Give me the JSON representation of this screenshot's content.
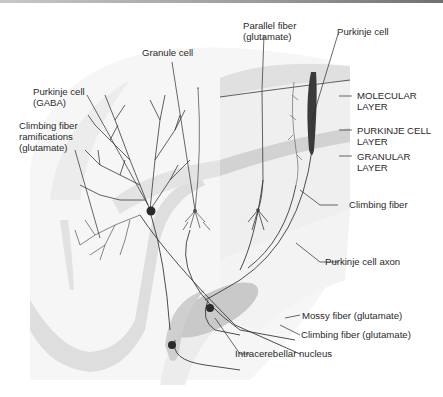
{
  "figure": {
    "colors": {
      "line": "#3a3a3a",
      "cell_body": "#2a2a2a",
      "layer_band": "#d4d4d4",
      "block_face": "#eeeeee",
      "block_top": "#e2e2e2",
      "nucleus": "#c6c6c6",
      "folia": "#f1f1f1",
      "folia_band": "#dcdcdc"
    },
    "labels": {
      "granule_cell": [
        "Granule cell"
      ],
      "purkinje_gaba": [
        "Purkinje cell",
        "(GABA)"
      ],
      "climbing_ramifications": [
        "Climbing fiber",
        "ramifications",
        "(glutamate)"
      ],
      "parallel_fiber": [
        "Parallel fiber",
        "(glutamate)"
      ],
      "purkinje_cell": [
        "Purkinje cell"
      ],
      "molecular_layer": [
        "MOLECULAR",
        "LAYER"
      ],
      "purkinje_layer": [
        "PURKINJE CELL",
        "LAYER"
      ],
      "granular_layer": [
        "GRANULAR",
        "LAYER"
      ],
      "climbing_fiber": [
        "Climbing fiber"
      ],
      "purkinje_axon": [
        "Purkinje cell axon"
      ],
      "mossy_fiber": [
        "Mossy fiber (glutamate)"
      ],
      "climbing_fiber_glu": [
        "Climbing fiber (glutamate)"
      ],
      "intracerebellar_nucleus": [
        "Intracerebellar nucleus"
      ]
    }
  }
}
